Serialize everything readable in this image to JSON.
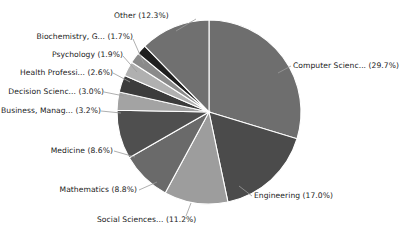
{
  "chart_data": {
    "type": "pie",
    "title": "",
    "subtitle": "",
    "xlabel": "",
    "ylabel": "",
    "grid": false,
    "legend_position": "none",
    "label_format": "name (percent%)",
    "start_angle_deg": 0,
    "direction": "clockwise",
    "units": "percent",
    "total": 100.0,
    "categories": [
      "Computer Scienc...",
      "Engineering",
      "Social Sciences...",
      "Mathematics",
      "Medicine",
      "Business, Manag...",
      "Decision Scienc...",
      "Health Professi...",
      "Psychology",
      "Biochemistry, G...",
      "Other"
    ],
    "values": [
      29.7,
      17.0,
      11.2,
      8.8,
      8.6,
      3.2,
      3.0,
      2.6,
      1.9,
      1.7,
      12.3
    ],
    "colors": [
      "#6e6e6e",
      "#4b4b4b",
      "#9d9d9d",
      "#6a6a6a",
      "#4f4f4f",
      "#a3a3a3",
      "#3c3c3c",
      "#b0b0b0",
      "#8a8a8a",
      "#1f1f1f",
      "#707070"
    ],
    "slices": [
      {
        "label": "Computer Scienc...",
        "percent": 29.7,
        "text": "Computer Scienc... (29.7%)",
        "color": "#6e6e6e"
      },
      {
        "label": "Engineering",
        "percent": 17.0,
        "text": "Engineering (17.0%)",
        "color": "#4b4b4b"
      },
      {
        "label": "Social Sciences...",
        "percent": 11.2,
        "text": "Social Sciences... (11.2%)",
        "color": "#9d9d9d"
      },
      {
        "label": "Mathematics",
        "percent": 8.8,
        "text": "Mathematics (8.8%)",
        "color": "#6a6a6a"
      },
      {
        "label": "Medicine",
        "percent": 8.6,
        "text": "Medicine (8.6%)",
        "color": "#4f4f4f"
      },
      {
        "label": "Business, Manag...",
        "percent": 3.2,
        "text": "Business, Manag... (3.2%)",
        "color": "#a3a3a3"
      },
      {
        "label": "Decision Scienc...",
        "percent": 3.0,
        "text": "Decision Scienc... (3.0%)",
        "color": "#3c3c3c"
      },
      {
        "label": "Health Professi...",
        "percent": 2.6,
        "text": "Health Professi... (2.6%)",
        "color": "#b0b0b0"
      },
      {
        "label": "Psychology",
        "percent": 1.9,
        "text": "Psychology (1.9%)",
        "color": "#8a8a8a"
      },
      {
        "label": "Biochemistry, G...",
        "percent": 1.7,
        "text": "Biochemistry, G... (1.7%)",
        "color": "#1f1f1f"
      },
      {
        "label": "Other",
        "percent": 12.3,
        "text": "Other (12.3%)",
        "color": "#707070"
      }
    ]
  },
  "figure": {
    "background": "#ffffff",
    "slice_border_color": "#ffffff",
    "leader_line_color": "#9a9a9a",
    "label_text_color": "#1a1a1a"
  },
  "labels": {
    "computer_science": "Computer Scienc... (29.7%)",
    "engineering": "Engineering (17.0%)",
    "social_sciences": "Social Sciences... (11.2%)",
    "mathematics": "Mathematics (8.8%)",
    "medicine": "Medicine (8.6%)",
    "business": "Business, Manag... (3.2%)",
    "decision_sciences": "Decision Scienc... (3.0%)",
    "health_professions": "Health Professi... (2.6%)",
    "psychology": "Psychology (1.9%)",
    "biochemistry": "Biochemistry, G... (1.7%)",
    "other": "Other (12.3%)"
  }
}
